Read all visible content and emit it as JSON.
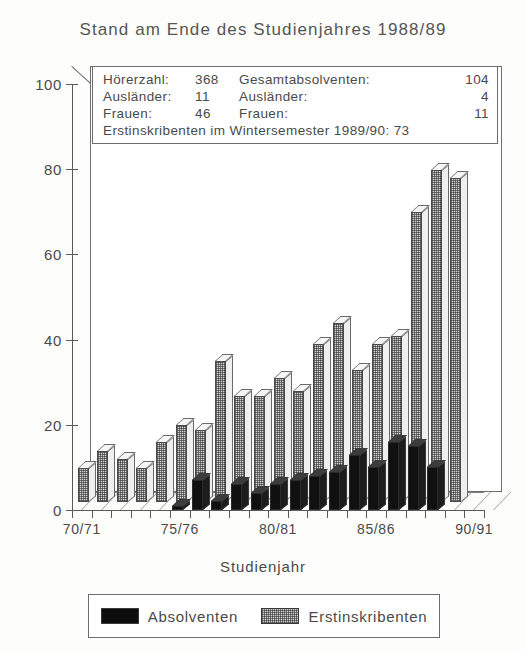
{
  "title": "Stand am Ende des Studienjahres 1988/89",
  "info_box": {
    "left": [
      {
        "label": "Hörerzahl:",
        "value": "368"
      },
      {
        "label": "Ausländer:",
        "value": "11"
      },
      {
        "label": "Frauen:",
        "value": "46"
      }
    ],
    "right": [
      {
        "label": "Gesamtabsolventen:",
        "value": "104"
      },
      {
        "label": "Ausländer:",
        "value": "4"
      },
      {
        "label": "Frauen:",
        "value": "11"
      }
    ],
    "footer": "Erstinskribenten im Wintersemester 1989/90: 73"
  },
  "legend": [
    {
      "key": "absolventen",
      "label": "Absolventen",
      "style": "dark",
      "color": "#0d0d0d"
    },
    {
      "key": "erstinskribenten",
      "label": "Erstinskribenten",
      "style": "hatch",
      "color": "#cfcfcf"
    }
  ],
  "chart_data": {
    "type": "bar",
    "title": "Stand am Ende des Studienjahres 1988/89",
    "xlabel": "Studienjahr",
    "ylabel": "",
    "ylim": [
      0,
      100
    ],
    "yticks": [
      0,
      20,
      40,
      60,
      80,
      100
    ],
    "grid": false,
    "legend_position": "bottom",
    "categories": [
      "70/71",
      "71/72",
      "72/73",
      "73/74",
      "74/75",
      "75/76",
      "76/77",
      "77/78",
      "78/79",
      "79/80",
      "80/81",
      "81/82",
      "82/83",
      "83/84",
      "84/85",
      "85/86",
      "86/87",
      "87/88",
      "88/89",
      "89/90",
      "90/91"
    ],
    "tick_labels": [
      "70/71",
      "75/76",
      "80/81",
      "85/86",
      "90/91"
    ],
    "series": [
      {
        "name": "Absolventen",
        "color": "#0d0d0d",
        "values": [
          0,
          0,
          0,
          0,
          0,
          1,
          7,
          2,
          6,
          4,
          6,
          7,
          8,
          9,
          13,
          10,
          16,
          15,
          10,
          0,
          0
        ]
      },
      {
        "name": "Erstinskribenten",
        "color": "#cfcfcf",
        "values": [
          8,
          12,
          10,
          8,
          14,
          18,
          17,
          33,
          25,
          25,
          29,
          26,
          37,
          42,
          31,
          37,
          39,
          68,
          78,
          76,
          0
        ]
      }
    ]
  },
  "axis_title": "Studienjahr"
}
